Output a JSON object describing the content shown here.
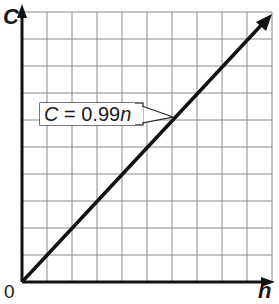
{
  "chart_data": {
    "type": "line",
    "title": "",
    "xlabel": "n",
    "ylabel": "C",
    "origin_label": "0",
    "grid": true,
    "grid_divisions": {
      "x": 10,
      "y": 10
    },
    "series": [
      {
        "name": "C = 0.99n",
        "x": [
          0,
          10
        ],
        "values": [
          0,
          9.9
        ]
      }
    ],
    "annotations": [
      {
        "text": "C = 0.99n",
        "points_to": "line"
      }
    ],
    "line_color": "#111111",
    "grid_color": "#8a8a8a"
  },
  "labels": {
    "y_axis": "C",
    "x_axis": "n",
    "origin": "0",
    "equation": "C = 0.99n"
  }
}
